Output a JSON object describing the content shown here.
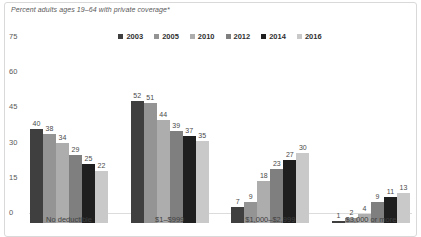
{
  "chart_data": {
    "type": "bar",
    "title": "Percent adults ages 19–64 with private coverage*",
    "categories": [
      "No deductible",
      "$1–$999",
      "$1,000–$2,999",
      "$3,000 or more"
    ],
    "series": [
      {
        "name": "2003",
        "color": "#3f3f3f",
        "values": [
          40,
          52,
          7,
          1
        ]
      },
      {
        "name": "2005",
        "color": "#949494",
        "values": [
          38,
          51,
          9,
          2
        ]
      },
      {
        "name": "2010",
        "color": "#adadad",
        "values": [
          34,
          44,
          18,
          4
        ]
      },
      {
        "name": "2012",
        "color": "#7f7f7f",
        "values": [
          29,
          39,
          23,
          9
        ]
      },
      {
        "name": "2014",
        "color": "#1f1f1f",
        "values": [
          25,
          37,
          27,
          11
        ]
      },
      {
        "name": "2016",
        "color": "#c9c9c9",
        "values": [
          22,
          35,
          30,
          13
        ]
      }
    ],
    "y_ticks": [
      0,
      15,
      30,
      45,
      60,
      75
    ],
    "ylim": [
      0,
      75
    ],
    "grid": false,
    "legend_position": "top-center",
    "value_labels": true,
    "frame_border_color": "#d9d9d9",
    "axis_text_color": "#595959"
  }
}
